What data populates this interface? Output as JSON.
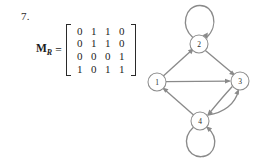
{
  "problem": {
    "number": "7.",
    "matrix_label": "M",
    "matrix_label_subscript": "R",
    "equals": "=",
    "matrix": {
      "rows": [
        [
          "0",
          "1",
          "1",
          "0"
        ],
        [
          "0",
          "1",
          "1",
          "0"
        ],
        [
          "0",
          "0",
          "0",
          "1"
        ],
        [
          "1",
          "0",
          "1",
          "1"
        ]
      ]
    }
  },
  "graph": {
    "nodes": [
      {
        "id": "1",
        "label": "1",
        "cx": 17,
        "cy": 82,
        "r": 9
      },
      {
        "id": "2",
        "label": "2",
        "cx": 59,
        "cy": 44,
        "r": 9
      },
      {
        "id": "3",
        "label": "3",
        "cx": 100,
        "cy": 81,
        "r": 9
      },
      {
        "id": "4",
        "label": "4",
        "cx": 60,
        "cy": 121,
        "r": 9
      }
    ],
    "edges": [
      {
        "from": "1",
        "to": "2",
        "type": "straight"
      },
      {
        "from": "1",
        "to": "3",
        "type": "straight"
      },
      {
        "from": "2",
        "to": "2",
        "type": "self-loop",
        "position": "top"
      },
      {
        "from": "2",
        "to": "3",
        "type": "straight"
      },
      {
        "from": "3",
        "to": "4",
        "type": "curved"
      },
      {
        "from": "4",
        "to": "3",
        "type": "curved"
      },
      {
        "from": "4",
        "to": "1",
        "type": "straight"
      },
      {
        "from": "4",
        "to": "4",
        "type": "self-loop",
        "position": "bottom"
      }
    ],
    "colors": {
      "edge": "#8a8a8a",
      "node_stroke": "#8d8d8d",
      "node_fill": "#ffffff",
      "label": "#2a2a2a"
    }
  }
}
